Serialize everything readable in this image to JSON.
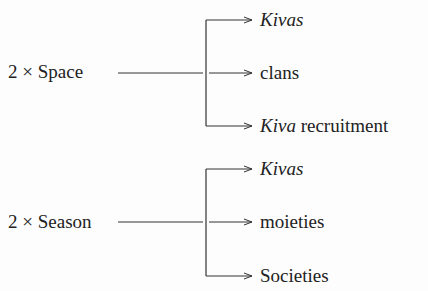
{
  "groups": [
    {
      "source": "2 × Space",
      "targets": [
        {
          "italic": "Kivas",
          "rest": ""
        },
        {
          "italic": "",
          "rest": "clans"
        },
        {
          "italic": "Kiva",
          "rest": " recruitment"
        }
      ]
    },
    {
      "source": "2 × Season",
      "targets": [
        {
          "italic": "Kivas",
          "rest": ""
        },
        {
          "italic": "",
          "rest": "moieties"
        },
        {
          "italic": "",
          "rest": "Societies"
        }
      ]
    }
  ],
  "colors": {
    "line": "#333333",
    "text": "#222222",
    "background": "#fdfdfd"
  }
}
